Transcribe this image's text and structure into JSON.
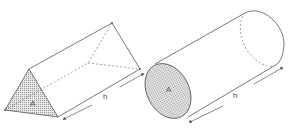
{
  "diagram": {
    "colors": {
      "line": "#555555",
      "dashed": "#777777",
      "fill": "#d6d6d6",
      "background": "#ffffff"
    },
    "shapes": [
      {
        "name": "triangular-prism",
        "base_label": "A",
        "height_label": "h"
      },
      {
        "name": "cylinder",
        "base_label": "A",
        "height_label": "h"
      }
    ]
  }
}
